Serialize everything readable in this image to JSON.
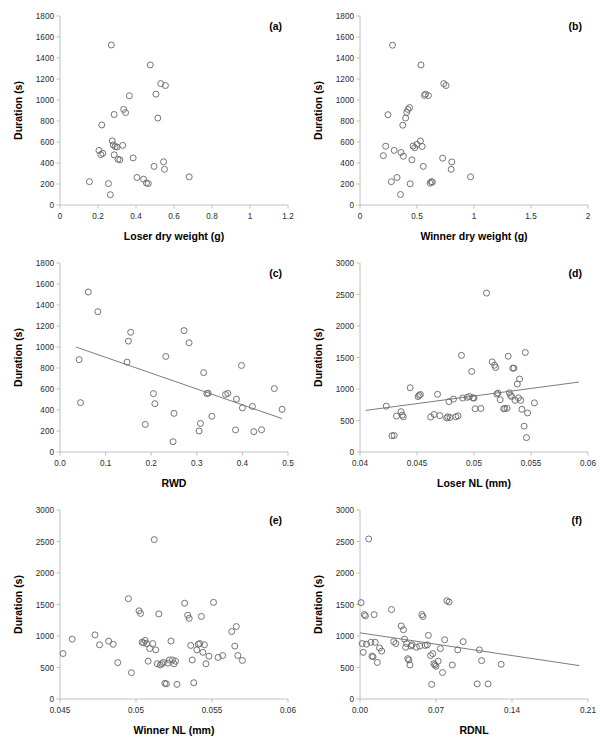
{
  "figure": {
    "title": "",
    "panel_count": 6,
    "point_color": "#6d6d6d",
    "axis_color": "#b9b9b9"
  },
  "chart_data": [
    {
      "type": "scatter",
      "panel": "(a)",
      "title": "",
      "xlabel": "Loser dry weight (g)",
      "ylabel": "Duration (s)",
      "xlim": [
        0,
        1.2
      ],
      "ylim": [
        0,
        1800
      ],
      "xticks": [
        0,
        0.2,
        0.4,
        0.6,
        0.8,
        1,
        1.2
      ],
      "xticklabels": [
        "0",
        "0.2",
        "0.4",
        "0.6",
        "0.8",
        "1",
        "1.2"
      ],
      "yticks": [
        0,
        200,
        400,
        600,
        800,
        1000,
        1200,
        1400,
        1600,
        1800
      ],
      "yticklabels": [
        "0",
        "200",
        "400",
        "600",
        "800",
        "1000",
        "1200",
        "1400",
        "1600",
        "1800"
      ],
      "grid": false,
      "legend": null,
      "trendline": null,
      "x": [
        0.155,
        0.205,
        0.215,
        0.22,
        0.225,
        0.255,
        0.265,
        0.27,
        0.275,
        0.28,
        0.285,
        0.285,
        0.29,
        0.3,
        0.305,
        0.315,
        0.33,
        0.335,
        0.345,
        0.365,
        0.385,
        0.405,
        0.44,
        0.455,
        0.465,
        0.475,
        0.495,
        0.505,
        0.515,
        0.53,
        0.545,
        0.55,
        0.555,
        0.68,
        0.685,
        0.69,
        0.745,
        0.95,
        1.1
      ],
      "y": [
        222,
        520,
        480,
        762,
        492,
        204,
        98,
        1524,
        610,
        572,
        862,
        478,
        556,
        552,
        436,
        430,
        568,
        910,
        880,
        1040,
        448,
        262,
        246,
        210,
        204,
        1334,
        368,
        1056,
        828,
        1156,
        412,
        340,
        1138,
        268
      ],
      "n_points": 39
    },
    {
      "type": "scatter",
      "panel": "(b)",
      "title": "",
      "xlabel": "Winner dry weight (g)",
      "ylabel": "Duration (s)",
      "xlim": [
        0,
        2
      ],
      "ylim": [
        0,
        1800
      ],
      "xticks": [
        0,
        0.5,
        1,
        1.5,
        2
      ],
      "xticklabels": [
        "0",
        "0.5",
        "1",
        "1.5",
        "2"
      ],
      "yticks": [
        0,
        200,
        400,
        600,
        800,
        1000,
        1200,
        1400,
        1600,
        1800
      ],
      "yticklabels": [
        "0",
        "200",
        "400",
        "600",
        "800",
        "1000",
        "1200",
        "1400",
        "1600",
        "1800"
      ],
      "grid": false,
      "legend": null,
      "trendline": null,
      "x": [
        0.205,
        0.225,
        0.245,
        0.275,
        0.285,
        0.3,
        0.325,
        0.355,
        0.36,
        0.375,
        0.38,
        0.4,
        0.41,
        0.42,
        0.435,
        0.44,
        0.455,
        0.465,
        0.48,
        0.5,
        0.53,
        0.535,
        0.545,
        0.555,
        0.565,
        0.575,
        0.6,
        0.615,
        0.625,
        0.635,
        0.725,
        0.735,
        0.755,
        0.8,
        0.805,
        0.97,
        1.12,
        1.13,
        1.355,
        1.6
      ],
      "y": [
        470,
        560,
        860,
        222,
        1522,
        520,
        262,
        100,
        500,
        760,
        464,
        828,
        882,
        910,
        928,
        202,
        430,
        562,
        546,
        578,
        610,
        1334,
        558,
        368,
        1044,
        1056,
        1042,
        208,
        222,
        218,
        446,
        1156,
        1138,
        340,
        410,
        268
      ],
      "n_points": 40
    },
    {
      "type": "scatter",
      "panel": "(c)",
      "title": "",
      "xlabel": "RWD",
      "ylabel": "Duration (s)",
      "xlim": [
        0,
        0.5
      ],
      "ylim": [
        0,
        1800
      ],
      "xticks": [
        0,
        0.1,
        0.2,
        0.3,
        0.4,
        0.5
      ],
      "xticklabels": [
        "0.0",
        "0.1",
        "0.2",
        "0.3",
        "0.4",
        "0.5"
      ],
      "yticks": [
        0,
        200,
        400,
        600,
        800,
        1000,
        1200,
        1400,
        1600,
        1800
      ],
      "yticklabels": [
        "0",
        "200",
        "400",
        "600",
        "800",
        "1000",
        "1200",
        "1400",
        "1600",
        "1800"
      ],
      "grid": false,
      "legend": null,
      "trendline": {
        "x0": 0.035,
        "y0": 1000,
        "x1": 0.487,
        "y1": 318
      },
      "x": [
        0.042,
        0.045,
        0.062,
        0.083,
        0.147,
        0.15,
        0.155,
        0.187,
        0.205,
        0.208,
        0.232,
        0.248,
        0.25,
        0.272,
        0.283,
        0.305,
        0.308,
        0.315,
        0.322,
        0.325,
        0.333,
        0.363,
        0.368,
        0.385,
        0.387,
        0.398,
        0.4,
        0.422,
        0.425,
        0.442,
        0.47,
        0.487
      ],
      "y": [
        880,
        470,
        1524,
        1336,
        856,
        1056,
        1140,
        262,
        556,
        460,
        910,
        98,
        368,
        1156,
        1040,
        200,
        272,
        756,
        556,
        560,
        340,
        548,
        558,
        210,
        504,
        824,
        420,
        434,
        194,
        212,
        604,
        406
      ],
      "n_points": 32
    },
    {
      "type": "scatter",
      "panel": "(d)",
      "title": "",
      "xlabel": "Loser NL (mm)",
      "ylabel": "Duration (s)",
      "xlim": [
        0.04,
        0.06
      ],
      "ylim": [
        0,
        3000
      ],
      "xticks": [
        0.04,
        0.045,
        0.05,
        0.055,
        0.06
      ],
      "xticklabels": [
        "0.04",
        "0.045",
        "0.05",
        "0.055",
        "0.06"
      ],
      "yticks": [
        0,
        500,
        1000,
        1500,
        2000,
        2500,
        3000
      ],
      "yticklabels": [
        "0",
        "500",
        "1000",
        "1500",
        "2000",
        "2500",
        "3000"
      ],
      "grid": false,
      "legend": null,
      "trendline": {
        "x0": 0.0405,
        "y0": 660,
        "x1": 0.0592,
        "y1": 1110
      },
      "x": [
        0.0423,
        0.0428,
        0.043,
        0.0432,
        0.0436,
        0.0437,
        0.0438,
        0.0444,
        0.0451,
        0.0452,
        0.0453,
        0.0462,
        0.0465,
        0.0468,
        0.047,
        0.0476,
        0.0477,
        0.0478,
        0.0479,
        0.0482,
        0.0484,
        0.0486,
        0.0489,
        0.049,
        0.0494,
        0.0496,
        0.0498,
        0.0499,
        0.05,
        0.0501,
        0.0506,
        0.0511,
        0.0516,
        0.0518,
        0.0519,
        0.052,
        0.0521,
        0.0523,
        0.0526,
        0.0527,
        0.0529,
        0.053,
        0.0531,
        0.0532,
        0.0533,
        0.0534,
        0.0535,
        0.0536,
        0.0538,
        0.0539,
        0.054,
        0.0541,
        0.0542,
        0.0544,
        0.0545,
        0.0546,
        0.0547,
        0.0553,
        0.0556,
        0.0559,
        0.0568,
        0.0592
      ],
      "y": [
        728,
        258,
        262,
        570,
        640,
        586,
        560,
        1020,
        880,
        900,
        912,
        556,
        596,
        916,
        578,
        540,
        560,
        800,
        548,
        840,
        560,
        574,
        1534,
        856,
        868,
        880,
        1278,
        860,
        856,
        686,
        690,
        2522,
        1430,
        1378,
        1340,
        920,
        936,
        830,
        686,
        690,
        694,
        1520,
        940,
        900,
        880,
        1330,
        1332,
        820,
        1080,
        860,
        1158,
        820,
        678,
        410,
        1580,
        228,
        620,
        780
      ],
      "n_points": 62
    },
    {
      "type": "scatter",
      "panel": "(e)",
      "title": "",
      "xlabel": "Winner NL (mm)",
      "ylabel": "Duration (s)",
      "xlim": [
        0.045,
        0.06
      ],
      "ylim": [
        0,
        3000
      ],
      "xticks": [
        0.045,
        0.05,
        0.055,
        0.06
      ],
      "xticklabels": [
        "0.045",
        "0.05",
        "0.055",
        "0.06"
      ],
      "yticks": [
        0,
        500,
        1000,
        1500,
        2000,
        2500,
        3000
      ],
      "yticklabels": [
        "0",
        "500",
        "1000",
        "1500",
        "2000",
        "2500",
        "3000"
      ],
      "grid": false,
      "legend": null,
      "trendline": null,
      "x": [
        0.0452,
        0.0458,
        0.0473,
        0.0476,
        0.0482,
        0.0485,
        0.0488,
        0.0495,
        0.0497,
        0.0502,
        0.0503,
        0.0504,
        0.0505,
        0.0506,
        0.0507,
        0.0508,
        0.0509,
        0.0511,
        0.0512,
        0.0513,
        0.0514,
        0.0515,
        0.0516,
        0.0517,
        0.0518,
        0.0519,
        0.052,
        0.0521,
        0.0522,
        0.0523,
        0.0524,
        0.0525,
        0.0526,
        0.0527,
        0.0532,
        0.0534,
        0.0535,
        0.0536,
        0.0537,
        0.0538,
        0.054,
        0.0541,
        0.0542,
        0.0543,
        0.0544,
        0.0545,
        0.0546,
        0.0548,
        0.0551,
        0.0554,
        0.0557,
        0.0563,
        0.0565,
        0.0566,
        0.0567,
        0.057,
        0.0591
      ],
      "y": [
        722,
        950,
        1018,
        860,
        918,
        868,
        578,
        1592,
        418,
        1400,
        1358,
        900,
        890,
        930,
        880,
        600,
        800,
        880,
        2530,
        780,
        560,
        1350,
        540,
        560,
        580,
        250,
        240,
        570,
        620,
        920,
        620,
        560,
        600,
        232,
        1520,
        1330,
        1280,
        850,
        620,
        258,
        780,
        870,
        880,
        1310,
        740,
        860,
        560,
        680,
        1534,
        660,
        690,
        1070,
        840,
        1150,
        690,
        612
      ],
      "n_points": 57
    },
    {
      "type": "scatter",
      "panel": "(f)",
      "title": "",
      "xlabel": "RDNL",
      "ylabel": "Duration (s)",
      "xlim": [
        0,
        0.21
      ],
      "ylim": [
        0,
        3000
      ],
      "xticks": [
        0,
        0.07,
        0.14,
        0.21
      ],
      "xticklabels": [
        "0.00",
        "0.07",
        "0.14",
        "0.21"
      ],
      "yticks": [
        0,
        500,
        1000,
        1500,
        2000,
        2500,
        3000
      ],
      "yticklabels": [
        "0",
        "500",
        "1000",
        "1500",
        "2000",
        "2500",
        "3000"
      ],
      "grid": false,
      "legend": null,
      "trendline": {
        "x0": 0.0,
        "y0": 1050,
        "x1": 0.202,
        "y1": 530
      },
      "x": [
        0.001,
        0.002,
        0.003,
        0.004,
        0.005,
        0.006,
        0.008,
        0.01,
        0.011,
        0.012,
        0.013,
        0.014,
        0.016,
        0.018,
        0.02,
        0.029,
        0.031,
        0.033,
        0.038,
        0.04,
        0.041,
        0.042,
        0.043,
        0.044,
        0.045,
        0.046,
        0.047,
        0.048,
        0.052,
        0.055,
        0.057,
        0.058,
        0.06,
        0.062,
        0.063,
        0.065,
        0.066,
        0.067,
        0.068,
        0.069,
        0.07,
        0.072,
        0.074,
        0.076,
        0.078,
        0.08,
        0.082,
        0.085,
        0.09,
        0.095,
        0.108,
        0.11,
        0.112,
        0.118,
        0.13,
        0.136,
        0.158,
        0.178,
        0.186,
        0.2,
        0.202
      ],
      "y": [
        1530,
        880,
        740,
        1340,
        1320,
        870,
        2540,
        900,
        680,
        670,
        1340,
        900,
        580,
        810,
        760,
        1420,
        910,
        880,
        1160,
        1100,
        950,
        820,
        880,
        640,
        620,
        540,
        840,
        860,
        820,
        840,
        1340,
        1310,
        850,
        860,
        1010,
        690,
        232,
        720,
        560,
        540,
        520,
        600,
        800,
        420,
        940,
        1560,
        1540,
        540,
        780,
        910,
        240,
        780,
        610,
        240,
        550
      ],
      "n_points": 61
    }
  ]
}
